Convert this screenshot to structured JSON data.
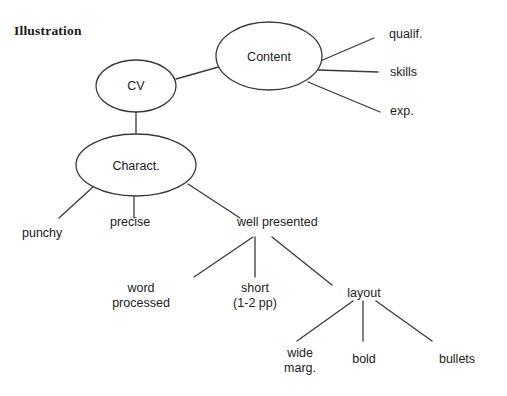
{
  "page": {
    "title": "Illustration",
    "background_color": "#ffffff",
    "stroke_color": "#3a3a3a",
    "text_color": "#222222"
  },
  "diagram": {
    "type": "tree-mind-map",
    "root": "CV",
    "nodes": [
      {
        "id": "cv",
        "label": "CV",
        "shape": "ellipse",
        "cx": 136,
        "cy": 86,
        "rx": 40,
        "ry": 26
      },
      {
        "id": "content",
        "label": "Content",
        "shape": "ellipse",
        "cx": 269,
        "cy": 56,
        "rx": 53,
        "ry": 34
      },
      {
        "id": "charact",
        "label": "Charact.",
        "shape": "ellipse",
        "cx": 136,
        "cy": 165,
        "rx": 60,
        "ry": 31
      },
      {
        "id": "qualif",
        "label": "qualif.",
        "shape": "text",
        "x": 389,
        "y": 34
      },
      {
        "id": "skills",
        "label": "skills",
        "shape": "text",
        "x": 390,
        "y": 72
      },
      {
        "id": "exp",
        "label": "exp.",
        "shape": "text",
        "x": 390,
        "y": 111
      },
      {
        "id": "punchy",
        "label": "punchy",
        "shape": "text",
        "x": 22,
        "y": 233
      },
      {
        "id": "precise",
        "label": "precise",
        "shape": "text",
        "x": 110,
        "y": 222
      },
      {
        "id": "well-presented",
        "label": "well presented",
        "shape": "text",
        "x": 237,
        "y": 222
      },
      {
        "id": "word-processed",
        "label": "word\nprocessed",
        "line1": "word",
        "line2": "processed",
        "shape": "text",
        "x": 141,
        "y": 287
      },
      {
        "id": "short",
        "label": "short\n(1-2 pp)",
        "line1": "short",
        "line2": "(1-2 pp)",
        "shape": "text",
        "x": 243,
        "y": 287
      },
      {
        "id": "layout",
        "label": "layout",
        "shape": "text",
        "x": 348,
        "y": 292
      },
      {
        "id": "wide-marg",
        "label": "wide\nmarg.",
        "line1": "wide",
        "line2": "marg.",
        "shape": "text",
        "x": 282,
        "y": 352
      },
      {
        "id": "bold",
        "label": "bold",
        "shape": "text",
        "x": 360,
        "y": 352
      },
      {
        "id": "bullets",
        "label": "bullets",
        "shape": "text",
        "x": 444,
        "y": 352
      }
    ],
    "edges": [
      {
        "from": "cv",
        "to": "content",
        "x1": 176,
        "y1": 79,
        "x2": 222,
        "y2": 66
      },
      {
        "from": "cv",
        "to": "charact",
        "x1": 136,
        "y1": 112,
        "x2": 136,
        "y2": 136
      },
      {
        "from": "content",
        "to": "qualif",
        "x1": 318,
        "y1": 62,
        "x2": 374,
        "y2": 38
      },
      {
        "from": "content",
        "to": "skills",
        "x1": 318,
        "y1": 70,
        "x2": 378,
        "y2": 72
      },
      {
        "from": "content",
        "to": "exp",
        "x1": 308,
        "y1": 82,
        "x2": 380,
        "y2": 112
      },
      {
        "from": "charact",
        "to": "punchy",
        "x1": 94,
        "y1": 186,
        "x2": 59,
        "y2": 218
      },
      {
        "from": "charact",
        "to": "precise",
        "x1": 134,
        "y1": 194,
        "x2": 134,
        "y2": 218
      },
      {
        "from": "charact",
        "to": "well-presented",
        "x1": 188,
        "y1": 184,
        "x2": 240,
        "y2": 218
      },
      {
        "from": "well-presented",
        "to": "word-processed",
        "x1": 253,
        "y1": 237,
        "x2": 194,
        "y2": 277
      },
      {
        "from": "well-presented",
        "to": "short",
        "x1": 255,
        "y1": 237,
        "x2": 255,
        "y2": 277
      },
      {
        "from": "well-presented",
        "to": "layout",
        "x1": 272,
        "y1": 237,
        "x2": 332,
        "y2": 285
      },
      {
        "from": "layout",
        "to": "wide-marg",
        "x1": 353,
        "y1": 301,
        "x2": 297,
        "y2": 341
      },
      {
        "from": "layout",
        "to": "bold",
        "x1": 363,
        "y1": 301,
        "x2": 363,
        "y2": 341
      },
      {
        "from": "layout",
        "to": "bullets",
        "x1": 376,
        "y1": 301,
        "x2": 432,
        "y2": 341
      }
    ]
  }
}
